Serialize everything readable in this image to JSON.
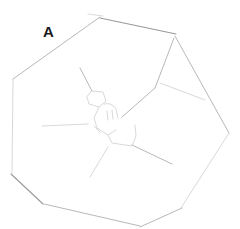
{
  "figure": {
    "panel_label": "A",
    "stroke_color": "#b8b8b8",
    "background": "#ffffff"
  }
}
